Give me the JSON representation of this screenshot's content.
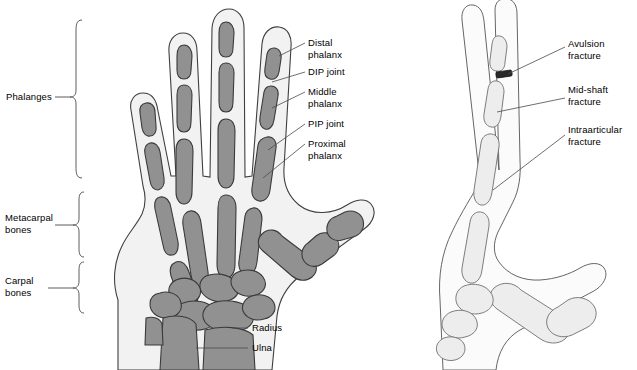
{
  "figure": {
    "background_color": "#ffffff",
    "bone_fill": "#8f8f8f",
    "bone_fill_light": "#e9e9e9",
    "soft_tissue_fill": "#f2f2f2",
    "outline_color": "#3a3a3a",
    "leader_color": "#4a4a4a",
    "text_color": "#000000"
  },
  "left_panel": {
    "name": "dorsal hand skeleton diagram",
    "bracket_labels": [
      {
        "id": "phalanges",
        "text": "Phalanges"
      },
      {
        "id": "metacarpal-bones",
        "text": "Metacarpal\nbones"
      },
      {
        "id": "carpal-bones",
        "text": "Carpal\nbones"
      }
    ],
    "leader_labels": [
      {
        "id": "distal-phalanx",
        "text": "Distal\nphalanx"
      },
      {
        "id": "dip-joint",
        "text": "DIP joint"
      },
      {
        "id": "middle-phalanx",
        "text": "Middle\nphalanx"
      },
      {
        "id": "pip-joint",
        "text": "PIP joint"
      },
      {
        "id": "proximal-phalanx",
        "text": "Proximal\nphalanx"
      },
      {
        "id": "radius",
        "text": "Radius"
      },
      {
        "id": "ulna",
        "text": "Ulna"
      }
    ]
  },
  "right_panel": {
    "name": "lateral thumb skeleton diagram with fractures",
    "leader_labels": [
      {
        "id": "avulsion-fracture",
        "text": "Avulsion\nfracture"
      },
      {
        "id": "mid-shaft-fracture",
        "text": "Mid-shaft\nfracture"
      },
      {
        "id": "intraarticular-fracture",
        "text": "Intraarticular\nfracture"
      }
    ]
  }
}
